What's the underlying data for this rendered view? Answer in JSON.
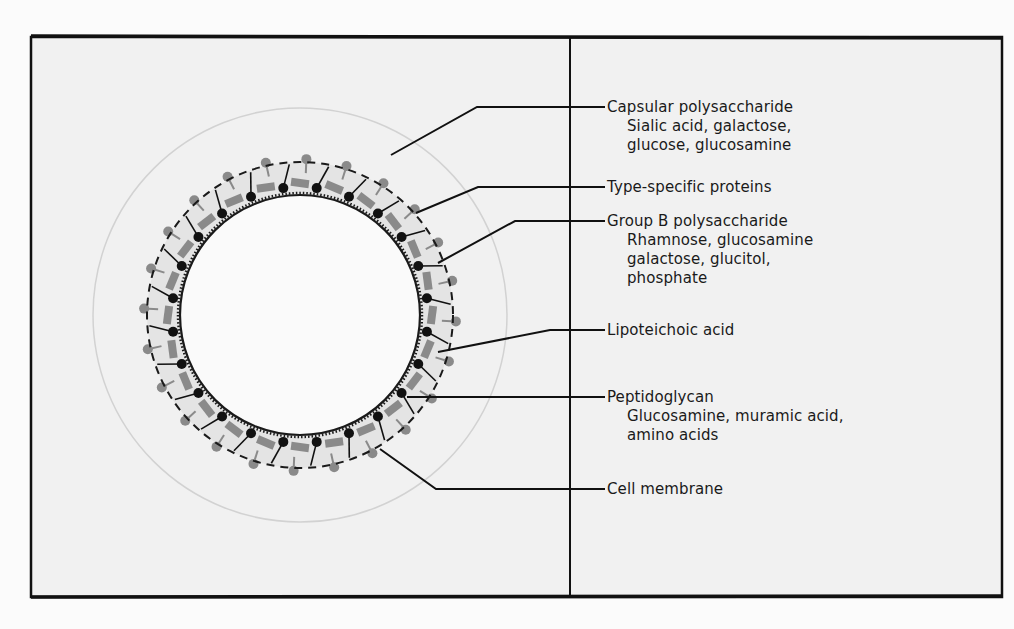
{
  "diagram": {
    "colors": {
      "background": "#f1f1f1",
      "frame": "#111111",
      "dark_knob": "#111111",
      "gray_component": "#8a8a8a",
      "light_capsule": "#d6d6d6"
    },
    "labels": [
      {
        "id": "capsular",
        "title": "Capsular polysaccharide",
        "details": [
          "Sialic acid, galactose,",
          "glucose, glucosamine"
        ]
      },
      {
        "id": "type-specific",
        "title": "Type-specific proteins",
        "details": []
      },
      {
        "id": "group-b",
        "title": "Group B polysaccharide",
        "details": [
          "Rhamnose, glucosamine",
          "galactose, glucitol,",
          "phosphate"
        ]
      },
      {
        "id": "lipoteichoic",
        "title": "Lipoteichoic acid",
        "details": []
      },
      {
        "id": "peptidoglycan",
        "title": "Peptidoglycan",
        "details": [
          "Glucosamine, muramic acid,",
          "amino acids"
        ]
      },
      {
        "id": "cell-membrane",
        "title": "Cell membrane",
        "details": []
      }
    ]
  }
}
